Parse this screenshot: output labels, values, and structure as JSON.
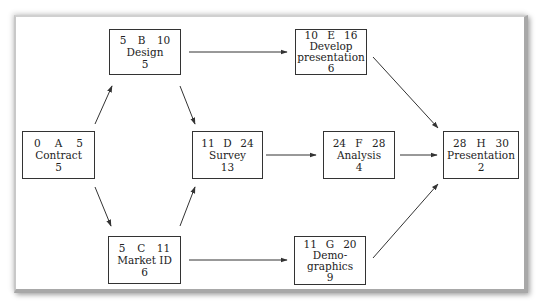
{
  "diagram": {
    "type": "activity-on-node network",
    "nodes": [
      {
        "id": "A",
        "es": "0",
        "ef": "5",
        "name": "Contract",
        "duration": "5"
      },
      {
        "id": "B",
        "es": "5",
        "ef": "10",
        "name": "Design",
        "duration": "5"
      },
      {
        "id": "C",
        "es": "5",
        "ef": "11",
        "name": "Market ID",
        "duration": "6"
      },
      {
        "id": "D",
        "es": "11",
        "ef": "24",
        "name": "Survey",
        "duration": "13"
      },
      {
        "id": "E",
        "es": "10",
        "ef": "16",
        "name": "Develop\npresentation",
        "duration": "6"
      },
      {
        "id": "F",
        "es": "24",
        "ef": "28",
        "name": "Analysis",
        "duration": "4"
      },
      {
        "id": "G",
        "es": "11",
        "ef": "20",
        "name": "Demo-\ngraphics",
        "duration": "9"
      },
      {
        "id": "H",
        "es": "28",
        "ef": "30",
        "name": "Presentation",
        "duration": "2"
      }
    ],
    "edges": [
      {
        "from": "A",
        "to": "B"
      },
      {
        "from": "A",
        "to": "C"
      },
      {
        "from": "B",
        "to": "E"
      },
      {
        "from": "B",
        "to": "D"
      },
      {
        "from": "C",
        "to": "D"
      },
      {
        "from": "C",
        "to": "G"
      },
      {
        "from": "D",
        "to": "F"
      },
      {
        "from": "E",
        "to": "H"
      },
      {
        "from": "F",
        "to": "H"
      },
      {
        "from": "G",
        "to": "H"
      }
    ]
  },
  "colors": {
    "line": "#333333",
    "frame_shadow": "#a8a8a8",
    "background": "#ffffff"
  }
}
